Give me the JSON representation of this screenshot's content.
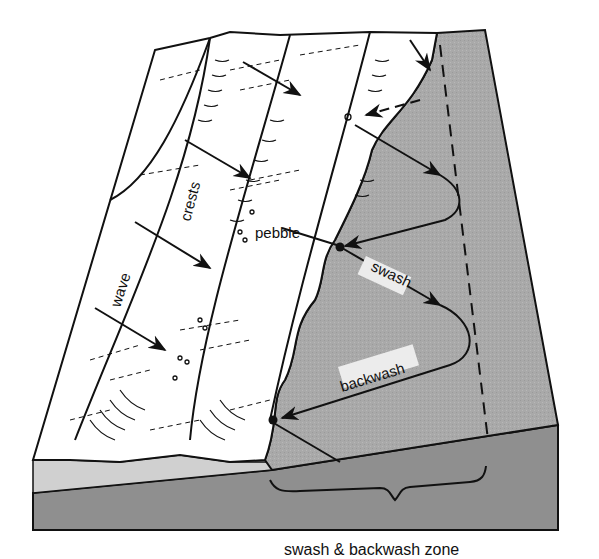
{
  "diagram": {
    "labels": {
      "wave": "wave",
      "crests": "crests",
      "pebble": "pebble",
      "swash": "swash",
      "backwash": "backwash",
      "caption": "swash & backwash zone"
    },
    "colors": {
      "background": "#ffffff",
      "beach_face": "#a9a9a9",
      "block_front": "#8f8f8f",
      "shallow_water_front": "#cfcfcf",
      "line": "#111111",
      "label_background": "#ececec"
    },
    "elements": [
      "wave-crest-1",
      "wave-crest-2",
      "wave-crest-3",
      "beach-slope",
      "pebble-path",
      "swash-arrows",
      "backwash-arrows",
      "dashed-limit-line",
      "zone-brace"
    ]
  }
}
